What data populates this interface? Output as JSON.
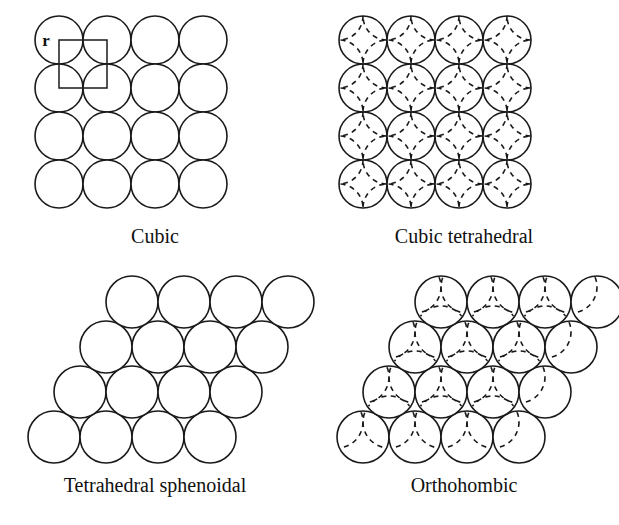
{
  "figure": {
    "title": "",
    "background_color": "#ffffff",
    "line_color": "#1a1a1a",
    "panel_count": 4
  },
  "panels": [
    {
      "id": "cubic",
      "caption": "Cubic",
      "packing": "simple-cubic",
      "rows": 4,
      "cols": 4,
      "sphere_diameter": 48,
      "row_offset_x": 0,
      "row_spacing_y": 48,
      "has_dashed_layer": false,
      "annotation": {
        "label": "r",
        "shape": "square",
        "description": "square connecting centers of four adjacent spheres"
      }
    },
    {
      "id": "cubic-tetrahedral",
      "caption": "Cubic tetrahedral",
      "packing": "simple-cubic",
      "rows": 4,
      "cols": 4,
      "sphere_diameter": 48,
      "row_offset_x": 0,
      "row_spacing_y": 48,
      "has_dashed_layer": true,
      "dashed_offset_x": 24,
      "dashed_offset_y": 24,
      "annotation": null
    },
    {
      "id": "tetrahedral-sphenoidal",
      "caption": "Tetrahedral sphenoidal",
      "packing": "sheared-rhombic",
      "rows": 4,
      "cols": 4,
      "sphere_diameter": 52,
      "row_offset_x": 26,
      "row_spacing_y": 45,
      "has_dashed_layer": false,
      "annotation": null
    },
    {
      "id": "orthohombic",
      "caption": "Orthohombic",
      "packing": "sheared-rhombic",
      "rows": 4,
      "cols": 4,
      "sphere_diameter": 52,
      "row_offset_x": 26,
      "row_spacing_y": 45,
      "has_dashed_layer": true,
      "dashed_offset_x": -26,
      "dashed_offset_y": -15,
      "annotation": null
    }
  ]
}
